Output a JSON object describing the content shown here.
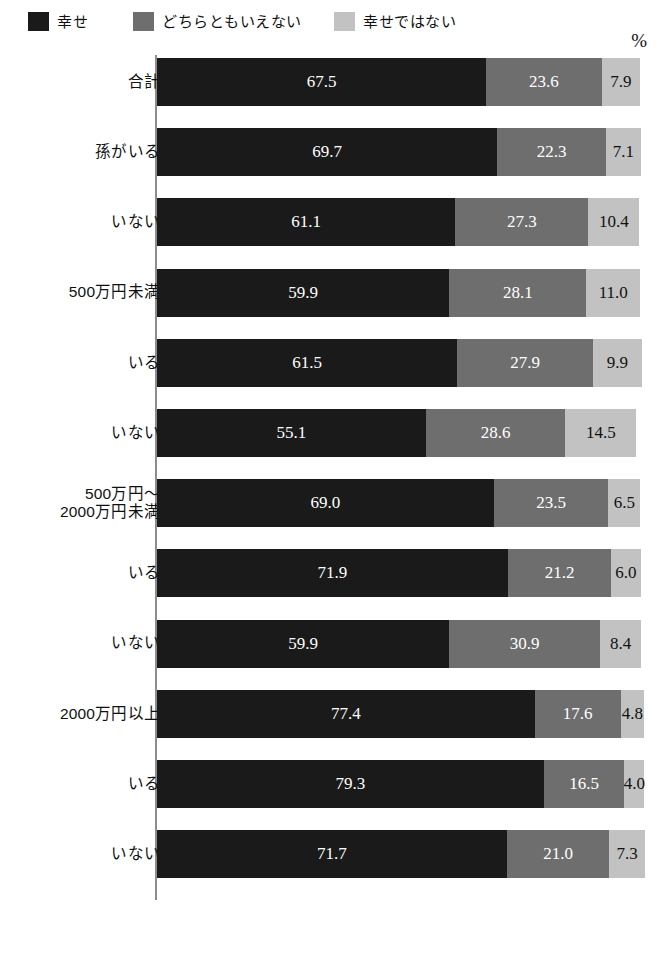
{
  "legend": {
    "items": [
      {
        "label": "幸せ",
        "color": "#1a1a1a",
        "icon": "legend-swatch-happy"
      },
      {
        "label": "どちらともいえない",
        "color": "#6e6e6e",
        "icon": "legend-swatch-neutral"
      },
      {
        "label": "幸せではない",
        "color": "#c2c2c2",
        "icon": "legend-swatch-unhappy"
      }
    ]
  },
  "axis": {
    "unit_label": "%"
  },
  "chart_data": {
    "type": "bar",
    "orientation": "horizontal",
    "stacked": true,
    "normalized_percent": true,
    "title": "",
    "subtitle": "",
    "xlabel": "%",
    "ylabel": "",
    "xlim": [
      0,
      100
    ],
    "grid": false,
    "legend_position": "top-left",
    "categories": [
      "合計",
      "孫がいる",
      "いない",
      "500万円未満",
      "いる",
      "いない",
      "500万円～\n2000万円未満",
      "いる",
      "いない",
      "2000万円以上",
      "いる",
      "いない"
    ],
    "series": [
      {
        "name": "幸せ",
        "color": "#1a1a1a",
        "values": [
          67.5,
          69.7,
          61.1,
          59.9,
          61.5,
          55.1,
          69.0,
          71.9,
          59.9,
          77.4,
          79.3,
          71.7
        ]
      },
      {
        "name": "どちらともいえない",
        "color": "#6e6e6e",
        "values": [
          23.6,
          22.3,
          27.3,
          28.1,
          27.9,
          28.6,
          23.5,
          21.2,
          30.9,
          17.6,
          16.5,
          21.0
        ]
      },
      {
        "name": "幸せではない",
        "color": "#c2c2c2",
        "values": [
          7.9,
          7.1,
          10.4,
          11.0,
          9.9,
          14.5,
          6.5,
          6.0,
          8.4,
          4.8,
          4.0,
          7.3
        ]
      }
    ]
  },
  "rows": [
    {
      "label_lines": [
        "合計"
      ],
      "values": [
        "67.5",
        "23.6",
        "7.9"
      ]
    },
    {
      "label_lines": [
        "孫がいる"
      ],
      "values": [
        "69.7",
        "22.3",
        "7.1"
      ]
    },
    {
      "label_lines": [
        "いない"
      ],
      "values": [
        "61.1",
        "27.3",
        "10.4"
      ]
    },
    {
      "label_lines": [
        "500万円未満"
      ],
      "values": [
        "59.9",
        "28.1",
        "11.0"
      ]
    },
    {
      "label_lines": [
        "いる"
      ],
      "values": [
        "61.5",
        "27.9",
        "9.9"
      ]
    },
    {
      "label_lines": [
        "いない"
      ],
      "values": [
        "55.1",
        "28.6",
        "14.5"
      ]
    },
    {
      "label_lines": [
        "500万円～",
        "2000万円未満"
      ],
      "values": [
        "69.0",
        "23.5",
        "6.5"
      ]
    },
    {
      "label_lines": [
        "いる"
      ],
      "values": [
        "71.9",
        "21.2",
        "6.0"
      ]
    },
    {
      "label_lines": [
        "いない"
      ],
      "values": [
        "59.9",
        "30.9",
        "8.4"
      ]
    },
    {
      "label_lines": [
        "2000万円以上"
      ],
      "values": [
        "77.4",
        "17.6",
        "4.8"
      ]
    },
    {
      "label_lines": [
        "いる"
      ],
      "values": [
        "79.3",
        "16.5",
        "4.0"
      ]
    },
    {
      "label_lines": [
        "いない"
      ],
      "values": [
        "71.7",
        "21.0",
        "7.3"
      ]
    }
  ]
}
